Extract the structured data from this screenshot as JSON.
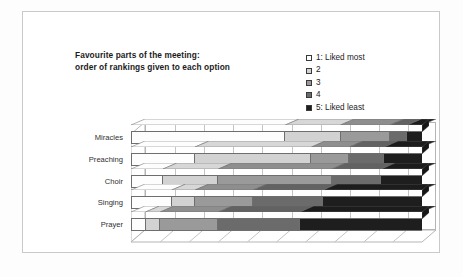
{
  "chart_data": {
    "type": "bar",
    "subtype": "100% stacked horizontal bar (3-D)",
    "title": "Favourite parts of the meeting:\norder of rankings given to each option",
    "title_line1": "Favourite parts of the meeting:",
    "title_line2": "order of rankings given to each option",
    "xlabel": "",
    "ylabel": "",
    "xlim": [
      0,
      100
    ],
    "grid": true,
    "gridlines": 10,
    "axis_tick_labels": [],
    "legend_position": "top-right",
    "orientation": "horizontal",
    "categories": [
      "Miracles",
      "Preaching",
      "Choir",
      "Singing",
      "Prayer"
    ],
    "legend": [
      {
        "label": "1: Liked most",
        "color": "#fdfdfd"
      },
      {
        "label": "2",
        "color": "#d2d2d2"
      },
      {
        "label": "3",
        "color": "#9a9a9a"
      },
      {
        "label": "4",
        "color": "#6b6b6b"
      },
      {
        "label": "5: Liked least",
        "color": "#1e1e1e"
      }
    ],
    "series": [
      {
        "name": "1: Liked most",
        "color": "#fdfdfd",
        "values": [
          53,
          22,
          11,
          14,
          5
        ]
      },
      {
        "name": "2",
        "color": "#d2d2d2",
        "values": [
          19,
          40,
          19,
          8,
          5
        ]
      },
      {
        "name": "3",
        "color": "#9a9a9a",
        "values": [
          17,
          13,
          39,
          20,
          20
        ]
      },
      {
        "name": "4",
        "color": "#6b6b6b",
        "values": [
          6,
          12,
          17,
          24,
          28
        ]
      },
      {
        "name": "5: Liked least",
        "color": "#1e1e1e",
        "values": [
          5,
          13,
          14,
          34,
          42
        ]
      }
    ],
    "rows": [
      {
        "category": "Miracles",
        "values": [
          53,
          19,
          17,
          6,
          5
        ]
      },
      {
        "category": "Preaching",
        "values": [
          22,
          40,
          13,
          12,
          13
        ]
      },
      {
        "category": "Choir",
        "values": [
          11,
          19,
          39,
          17,
          14
        ]
      },
      {
        "category": "Singing",
        "values": [
          14,
          8,
          20,
          24,
          34
        ]
      },
      {
        "category": "Prayer",
        "values": [
          5,
          5,
          20,
          28,
          42
        ]
      }
    ]
  }
}
